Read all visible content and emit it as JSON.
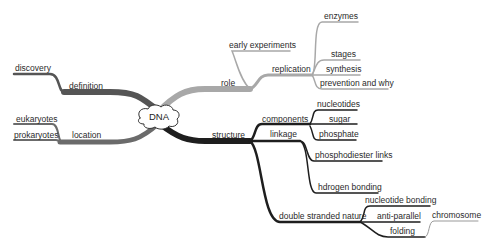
{
  "colors": {
    "background": "#ffffff",
    "definition_branch": "#555555",
    "location_branch": "#6b6b6b",
    "role_branch": "#a8a8a8",
    "structure_branch": "#1e1e1e",
    "text": "#2a2a2a"
  },
  "mindmap": {
    "central": {
      "label": "DNA",
      "shape": "cloud"
    },
    "branches": {
      "definition": {
        "label": "definition",
        "children": {
          "discovery": {
            "label": "discovery"
          }
        }
      },
      "location": {
        "label": "location",
        "children": {
          "eukaryotes": {
            "label": "eukaryotes"
          },
          "prokaryotes": {
            "label": "prokaryotes"
          }
        }
      },
      "role": {
        "label": "role",
        "children": {
          "early_experiments": {
            "label": "early experiments"
          },
          "replication": {
            "label": "replication",
            "children": {
              "enzymes": {
                "label": "enzymes"
              },
              "stages": {
                "label": "stages"
              },
              "synthesis": {
                "label": "synthesis"
              },
              "prevention": {
                "label": "prevention and why"
              }
            }
          }
        }
      },
      "structure": {
        "label": "structure",
        "children": {
          "components": {
            "label": "components",
            "children": {
              "nucleotides": {
                "label": "nucleotides"
              },
              "sugar": {
                "label": "sugar"
              },
              "phosphate": {
                "label": "phosphate"
              }
            }
          },
          "linkage": {
            "label": "linkage",
            "children": {
              "phosphodiester": {
                "label": "phosphodiester links"
              },
              "hydrogen": {
                "label": "hdrogen bonding"
              }
            }
          },
          "double_stranded": {
            "label": "double stranded nature",
            "children": {
              "nucleotide_bonding": {
                "label": "nucleotide bonding"
              },
              "anti_parallel": {
                "label": "anti-parallel"
              },
              "folding": {
                "label": "folding",
                "children": {
                  "chromosome": {
                    "label": "chromosome"
                  }
                }
              }
            }
          }
        }
      }
    }
  }
}
